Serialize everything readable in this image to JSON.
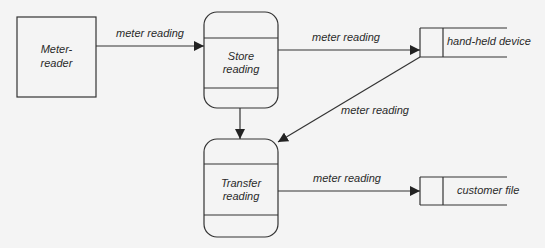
{
  "diagram": {
    "type": "data-flow-diagram",
    "colors": {
      "background": "#f4f4f4",
      "stroke": "#333333",
      "text": "#2a2a2a"
    },
    "external_entities": [
      {
        "id": "meter-reader",
        "label_lines": [
          "Meter-",
          "reader"
        ]
      }
    ],
    "processes": [
      {
        "id": "store-reading",
        "label_lines": [
          "Store",
          "reading"
        ]
      },
      {
        "id": "transfer-reading",
        "label_lines": [
          "Transfer",
          "reading"
        ]
      }
    ],
    "data_stores": [
      {
        "id": "hand-held-device",
        "label": "hand-held device"
      },
      {
        "id": "customer-file",
        "label": "customer file"
      }
    ],
    "flows": [
      {
        "from": "meter-reader",
        "to": "store-reading",
        "label": "meter reading"
      },
      {
        "from": "store-reading",
        "to": "hand-held-device",
        "label": "meter reading"
      },
      {
        "from": "store-reading",
        "to": "transfer-reading",
        "label": ""
      },
      {
        "from": "hand-held-device",
        "to": "transfer-reading",
        "label": "meter reading"
      },
      {
        "from": "transfer-reading",
        "to": "customer-file",
        "label": "meter reading"
      }
    ]
  }
}
